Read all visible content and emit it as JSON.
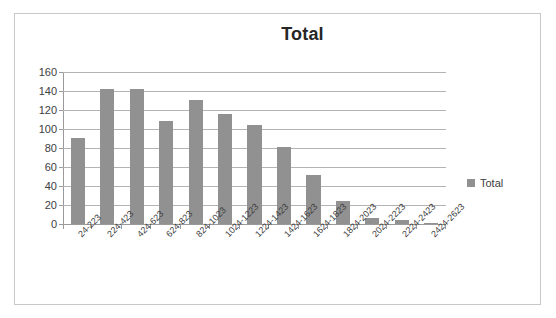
{
  "chart_data": {
    "type": "bar",
    "title": "Total",
    "xlabel": "",
    "ylabel": "",
    "ylim": [
      0,
      160
    ],
    "ytick_step": 20,
    "yticks": [
      160,
      140,
      120,
      100,
      80,
      60,
      40,
      20,
      0
    ],
    "grid": true,
    "legend_position": "right",
    "series_name": "Total",
    "bar_color": "#919191",
    "categories": [
      "24-223",
      "224-423",
      "424-623",
      "624-823",
      "824-1023",
      "1024-1223",
      "1224-1423",
      "1424-1623",
      "1624-1823",
      "1824-2023",
      "2024-2223",
      "2224-2423",
      "2424-2623"
    ],
    "values": [
      91,
      142,
      142,
      108,
      131,
      116,
      104,
      81,
      52,
      24,
      6,
      4,
      1
    ],
    "series": [
      {
        "name": "Total",
        "values": [
          91,
          142,
          142,
          108,
          131,
          116,
          104,
          81,
          52,
          24,
          6,
          4,
          1
        ]
      }
    ]
  },
  "legend": {
    "entries": [
      {
        "label": "Total",
        "color": "#919191"
      }
    ]
  }
}
